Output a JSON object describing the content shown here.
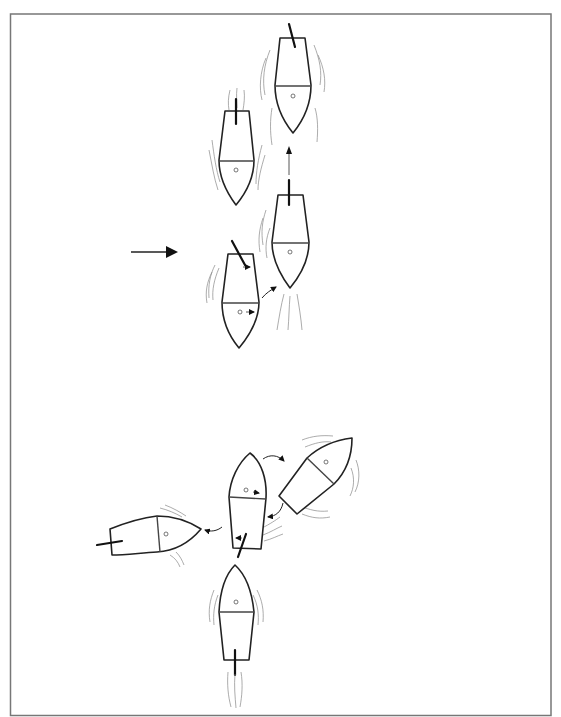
{
  "diagram": {
    "title": "",
    "colors": {
      "line": "#222222",
      "wake": "#888888",
      "background": "#ffffff",
      "border": "#777777"
    },
    "main_arrow": {
      "icon": "arrow-right",
      "direction": "right"
    },
    "upper_sequence": {
      "boats": [
        {
          "id": "A",
          "heading": "down",
          "rudder": "angled"
        },
        {
          "id": "B",
          "heading": "down",
          "rudder": "straight"
        },
        {
          "id": "C",
          "heading": "down",
          "rudder": "straight"
        },
        {
          "id": "D",
          "heading": "down",
          "rudder": "angled"
        }
      ],
      "arrows": [
        "D-to-C curved",
        "C-to-A straight up"
      ]
    },
    "lower_sequence": {
      "boats": [
        {
          "id": "E",
          "heading": "up",
          "rudder": "angled"
        },
        {
          "id": "F",
          "heading": "up-right",
          "rudder": "none"
        },
        {
          "id": "G",
          "heading": "right",
          "rudder": "straight"
        },
        {
          "id": "H",
          "heading": "up",
          "rudder": "straight"
        }
      ],
      "arrows": [
        "E-to-F curved",
        "F-to-E curved",
        "E-to-G curved"
      ]
    }
  }
}
